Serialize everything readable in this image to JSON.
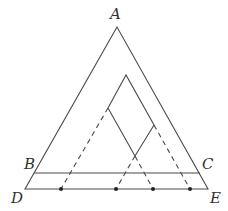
{
  "diagram": {
    "labels": {
      "A": "A",
      "B": "B",
      "C": "C",
      "D": "D",
      "E": "E"
    },
    "points": {
      "A": [
        117,
        27
      ],
      "B": [
        34,
        173
      ],
      "C": [
        200,
        173
      ],
      "D": [
        25,
        189
      ],
      "E": [
        208,
        189
      ],
      "inner_top": [
        126,
        75
      ],
      "inner_left": [
        108,
        108
      ],
      "inner_right": [
        154,
        125
      ],
      "inner_bottom": [
        135,
        156
      ]
    },
    "dots_on_DE": [
      61,
      116,
      153,
      190
    ],
    "colors": {
      "line": "#4a4a4a",
      "dot": "#222222",
      "label": "#333333",
      "background": "#ffffff"
    }
  }
}
